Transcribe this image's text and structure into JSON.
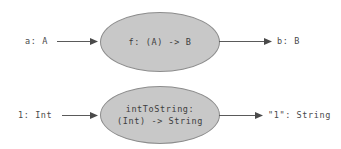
{
  "diagram": {
    "background_color": "#ffffff",
    "node_fill_color": "#c8c8c8",
    "node_stroke_color": "#8d8d8d",
    "text_color": "#3d3d3d",
    "arrow_color": "#5a5a5a",
    "rows": [
      {
        "id": "generic-function",
        "input_label": "a: A",
        "node_lines": [
          "f: (A) -> B"
        ],
        "output_label": "b: B"
      },
      {
        "id": "int-to-string",
        "input_label": "1: Int",
        "node_lines": [
          "intToString:",
          "(Int) -> String"
        ],
        "output_label": "\"1\": String"
      }
    ]
  }
}
